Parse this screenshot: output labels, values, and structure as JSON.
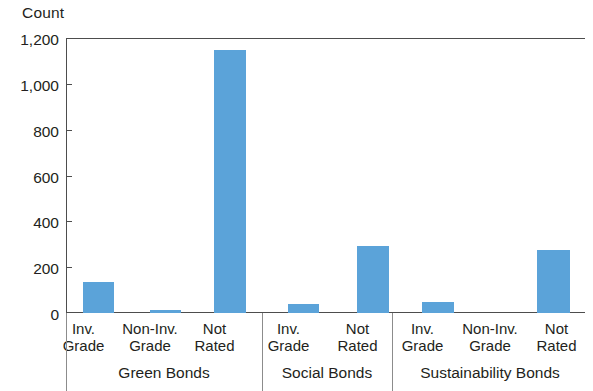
{
  "chart_data": {
    "type": "bar",
    "title": "",
    "subtitle": "",
    "xlabel": "",
    "ylabel": "Count",
    "ylim": [
      0,
      1200
    ],
    "yticks": [
      0,
      200,
      400,
      600,
      800,
      1000,
      1200
    ],
    "ytick_labels": [
      "0",
      "200",
      "400",
      "600",
      "800",
      "1,000",
      "1,200"
    ],
    "grid": false,
    "legend": "none",
    "bar_color": "#5ba3d9",
    "axis_color": "#4d4d4d",
    "groups": [
      {
        "name": "Green Bonds",
        "categories": [
          "Inv. Grade",
          "Non-Inv. Grade",
          "Not Rated"
        ],
        "values": [
          135,
          12,
          1148
        ]
      },
      {
        "name": "Social Bonds",
        "categories": [
          "Inv. Grade",
          "Not Rated"
        ],
        "values": [
          38,
          293
        ]
      },
      {
        "name": "Sustainability Bonds",
        "categories": [
          "Inv. Grade",
          "Non-Inv. Grade",
          "Not Rated"
        ],
        "values": [
          48,
          0,
          275
        ]
      }
    ],
    "categories": [
      "Green Bonds / Inv. Grade",
      "Green Bonds / Non-Inv. Grade",
      "Green Bonds / Not Rated",
      "Social Bonds / Inv. Grade",
      "Social Bonds / Not Rated",
      "Sustainability Bonds / Inv. Grade",
      "Sustainability Bonds / Non-Inv. Grade",
      "Sustainability Bonds / Not Rated"
    ],
    "values": [
      135,
      12,
      1148,
      38,
      293,
      48,
      0,
      275
    ]
  },
  "axis": {
    "y_title": "Count",
    "ytick_labels": [
      "1,200",
      "1,000",
      "800",
      "600",
      "400",
      "200",
      "0"
    ]
  },
  "cat_labels": [
    {
      "line1": "Inv.",
      "line2": "Grade"
    },
    {
      "line1": "Non-Inv.",
      "line2": "Grade"
    },
    {
      "line1": "Not",
      "line2": "Rated"
    },
    {
      "line1": "Inv.",
      "line2": "Grade"
    },
    {
      "line1": "Not",
      "line2": "Rated"
    },
    {
      "line1": "Inv.",
      "line2": "Grade"
    },
    {
      "line1": "Non-Inv.",
      "line2": "Grade"
    },
    {
      "line1": "Not",
      "line2": "Rated"
    }
  ],
  "group_labels": [
    "Green Bonds",
    "Social Bonds",
    "Sustainability Bonds"
  ]
}
